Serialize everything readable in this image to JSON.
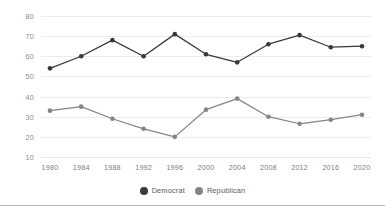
{
  "colors": {
    "democrat": "#3a3a3a",
    "republican": "#858585",
    "gridline": "#ececec",
    "axis": "#e6e6e6",
    "tick_text": "#8a8a8a",
    "legend_text": "#5a5a5a",
    "background": "#ffffff",
    "divider": "#b9b9b9"
  },
  "legend": {
    "position": "bottom-center",
    "entries": [
      {
        "label": "Democrat",
        "marker": "circle-marker",
        "color": "#3a3a3a"
      },
      {
        "label": "Republican",
        "marker": "circle-marker",
        "color": "#858585"
      }
    ]
  },
  "chart_data": {
    "type": "line",
    "title": "",
    "subtitle": "",
    "xlabel": "",
    "ylabel": "",
    "grid": true,
    "xlim": [
      1980,
      2020
    ],
    "ylim": [
      10,
      80
    ],
    "yticks": [
      80,
      70,
      60,
      50,
      40,
      30,
      20,
      10
    ],
    "ytick_labels": [
      "80",
      "70",
      "60",
      "50",
      "40",
      "30",
      "20",
      "10"
    ],
    "categories": [
      1980,
      1984,
      1988,
      1992,
      1996,
      2000,
      2004,
      2008,
      2012,
      2016,
      2020
    ],
    "xtick_labels": [
      "1980",
      "1984",
      "1988",
      "1992",
      "1996",
      "2000",
      "2004",
      "2008",
      "2012",
      "2016",
      "2020"
    ],
    "series": [
      {
        "name": "Democrat",
        "color": "#3a3a3a",
        "marker": "circle",
        "values": [
          54,
          60,
          68,
          60,
          71,
          61,
          57,
          66,
          70.5,
          64.5,
          65
        ]
      },
      {
        "name": "Republican",
        "color": "#858585",
        "marker": "circle",
        "values": [
          33,
          35,
          29,
          24,
          20,
          33.5,
          39,
          30,
          26.5,
          28.5,
          31
        ]
      }
    ]
  }
}
